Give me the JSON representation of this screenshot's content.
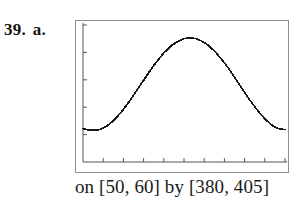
{
  "problem": {
    "number": "39.",
    "part": "a."
  },
  "caption": "on [50, 60] by [380, 405]",
  "chart_data": {
    "type": "line",
    "title": "",
    "subtitle": "",
    "xlabel": "",
    "ylabel": "",
    "xlim": [
      50,
      60
    ],
    "ylim": [
      380,
      405
    ],
    "grid": false,
    "legend": null,
    "window_notation": "on [50, 60] by [380, 405]",
    "x_tick_count": 11,
    "x_tick_step": 1,
    "x_ticks": [
      50,
      51,
      52,
      53,
      54,
      55,
      56,
      57,
      58,
      59,
      60
    ],
    "y_tick_count": 6,
    "y_tick_step": 5,
    "y_ticks": [
      380,
      385,
      390,
      395,
      400,
      405
    ],
    "axes_style": "calculator-screen-border-with-inner-tick-axes",
    "line_color": "#1a1a1a",
    "frame_color": "#8d8d8d",
    "series": [
      {
        "name": "curve",
        "x": [
          50.0,
          50.2,
          50.4,
          50.6,
          50.8,
          51.0,
          51.2,
          51.4,
          51.6,
          51.8,
          52.0,
          52.2,
          52.4,
          52.6,
          52.8,
          53.0,
          53.2,
          53.4,
          53.6,
          53.8,
          54.0,
          54.2,
          54.4,
          54.6,
          54.8,
          55.0,
          55.2,
          55.4,
          55.6,
          55.8,
          56.0,
          56.2,
          56.4,
          56.6,
          56.8,
          57.0,
          57.2,
          57.4,
          57.6,
          57.8,
          58.0,
          58.2,
          58.4,
          58.6,
          58.8,
          59.0,
          59.2,
          59.4,
          59.6,
          59.8,
          60.0
        ],
        "y": [
          386.1,
          385.9,
          385.8,
          385.8,
          385.9,
          386.2,
          386.6,
          387.2,
          387.9,
          388.7,
          389.6,
          390.6,
          391.6,
          392.7,
          393.8,
          394.9,
          396.0,
          397.1,
          398.1,
          399.0,
          399.9,
          400.6,
          401.3,
          401.8,
          402.2,
          402.5,
          402.6,
          402.6,
          402.5,
          402.2,
          401.8,
          401.3,
          400.6,
          399.9,
          399.0,
          398.1,
          397.1,
          396.0,
          394.9,
          393.8,
          392.7,
          391.6,
          390.6,
          389.6,
          388.7,
          387.9,
          387.2,
          386.6,
          386.2,
          386.0,
          385.9
        ]
      }
    ]
  }
}
